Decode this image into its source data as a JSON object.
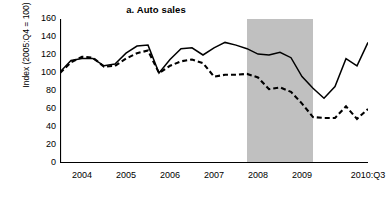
{
  "chart_data": {
    "type": "line",
    "title": "a. Auto sales",
    "xlabel": "",
    "ylabel": "Index (2005:Q4 = 100)",
    "ylim": [
      0,
      160
    ],
    "ytick_values": [
      0,
      20,
      40,
      60,
      80,
      100,
      120,
      140,
      160
    ],
    "ytick_labels": [
      "0",
      "20",
      "40",
      "60",
      "80",
      "100",
      "120",
      "140",
      "160"
    ],
    "xlim": [
      "2003:Q3",
      "2010:Q3"
    ],
    "xtick_labels": [
      "2004",
      "2005",
      "2006",
      "2007",
      "2008",
      "2009",
      "2010:Q3"
    ],
    "xtick_positions": [
      "2004:Q1",
      "2005:Q1",
      "2006:Q1",
      "2007:Q1",
      "2008:Q1",
      "2009:Q1",
      "2010:Q3"
    ],
    "minor_ticks": "quarterly",
    "grid": false,
    "legend": null,
    "x": [
      "2003:Q3",
      "2003:Q4",
      "2004:Q1",
      "2004:Q2",
      "2004:Q3",
      "2004:Q4",
      "2005:Q1",
      "2005:Q2",
      "2005:Q3",
      "2005:Q4",
      "2006:Q1",
      "2006:Q2",
      "2006:Q3",
      "2006:Q4",
      "2007:Q1",
      "2007:Q2",
      "2007:Q3",
      "2007:Q4",
      "2008:Q1",
      "2008:Q2",
      "2008:Q3",
      "2008:Q4",
      "2009:Q1",
      "2009:Q2",
      "2009:Q3",
      "2009:Q4",
      "2010:Q1",
      "2010:Q2",
      "2010:Q3"
    ],
    "series": [
      {
        "name": "solid-series",
        "style": "solid",
        "color": "#000000",
        "values": [
          101,
          114,
          116,
          116,
          108,
          110,
          122,
          130,
          131,
          100,
          115,
          127,
          128,
          120,
          128,
          134,
          131,
          127,
          121,
          120,
          123,
          117,
          96,
          83,
          72,
          85,
          116,
          108,
          134
        ]
      },
      {
        "name": "dashed-series",
        "style": "dashed",
        "color": "#000000",
        "values": [
          100,
          112,
          118,
          117,
          107,
          108,
          116,
          122,
          125,
          100,
          108,
          113,
          115,
          111,
          96,
          98,
          98,
          99,
          95,
          82,
          84,
          79,
          66,
          51,
          50,
          50,
          63,
          49,
          60
        ]
      }
    ],
    "shaded_regions": [
      {
        "name": "recession-band",
        "start": "2007:Q4",
        "end": "2009:Q2",
        "color": "#c0c0c0"
      }
    ]
  }
}
